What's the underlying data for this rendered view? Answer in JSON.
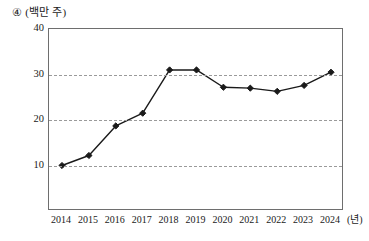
{
  "figure": {
    "item_number": "④",
    "unit_caption": "(백만 주)",
    "x_axis_unit": "(년)"
  },
  "chart_data": {
    "type": "line",
    "xlabel": "(년)",
    "ylabel": "(백만 주)",
    "categories": [
      "2014",
      "2015",
      "2016",
      "2017",
      "2018",
      "2019",
      "2020",
      "2021",
      "2022",
      "2023",
      "2024"
    ],
    "values": [
      10.0,
      12.2,
      18.7,
      21.5,
      31.0,
      31.0,
      27.2,
      27.0,
      26.3,
      27.6,
      30.5
    ],
    "ylim": [
      0,
      40
    ],
    "y_ticks": [
      10,
      20,
      30,
      40
    ],
    "y_tick_labels": [
      "10",
      "20",
      "30",
      "40"
    ],
    "grid": true,
    "grid_style": "dashed-horizontal",
    "legend": null,
    "series_color": "#1a1a1a",
    "marker": "diamond",
    "marker_size": 5
  },
  "style": {
    "line_color": "#1a1a1a",
    "marker_color": "#1a1a1a",
    "grid_color": "#9a9a9a",
    "frame_color": "#6e6e6e",
    "background": "#ffffff"
  }
}
